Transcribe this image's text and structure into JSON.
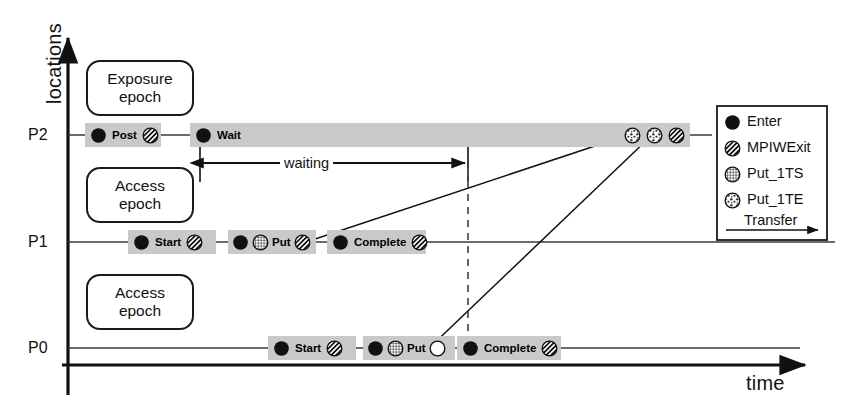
{
  "axes": {
    "y_label": "locations",
    "x_label": "time",
    "ticks": [
      "P2",
      "P1",
      "P0"
    ]
  },
  "epochs": [
    {
      "line1": "Exposure",
      "line2": "epoch"
    },
    {
      "line1": "Access",
      "line2": "epoch"
    },
    {
      "line1": "Access",
      "line2": "epoch"
    }
  ],
  "annotations": {
    "waiting": "waiting"
  },
  "timelines": [
    {
      "name": "P2",
      "boxes": [
        {
          "label": "Post",
          "icons": [
            "enter",
            "mpiwexit"
          ]
        },
        {
          "label": "Wait",
          "icons": [
            "enter"
          ],
          "tail_icons": [
            "put_1te",
            "put_1te",
            "mpiwexit"
          ]
        }
      ]
    },
    {
      "name": "P1",
      "boxes": [
        {
          "label": "Start",
          "icons": [
            "enter",
            "mpiwexit"
          ]
        },
        {
          "label": "Put",
          "icons": [
            "enter",
            "put_1ts",
            "mpiwexit"
          ]
        },
        {
          "label": "Complete",
          "icons": [
            "enter",
            "mpiwexit"
          ]
        }
      ]
    },
    {
      "name": "P0",
      "boxes": [
        {
          "label": "Start",
          "icons": [
            "enter",
            "mpiwexit"
          ]
        },
        {
          "label": "Put",
          "icons": [
            "enter",
            "put_1ts",
            "blank"
          ]
        },
        {
          "label": "Complete",
          "icons": [
            "enter",
            "mpiwexit"
          ]
        }
      ]
    }
  ],
  "legend": {
    "items": [
      {
        "icon": "enter",
        "label": "Enter"
      },
      {
        "icon": "mpiwexit",
        "label": "MPIWExit"
      },
      {
        "icon": "put_1ts",
        "label": "Put_1TS"
      },
      {
        "icon": "put_1te",
        "label": "Put_1TE"
      }
    ],
    "transfer_label": "Transfer"
  },
  "colors": {
    "box_fill": "#c9c9c9",
    "stroke": "#1a1a1a",
    "background": "#ffffff"
  }
}
